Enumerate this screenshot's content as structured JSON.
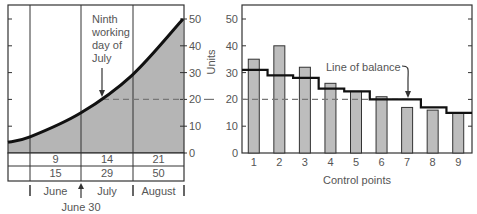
{
  "chart_data": [
    {
      "type": "area",
      "title": "",
      "ylabel": "",
      "ylim": [
        0,
        50
      ],
      "yticks": [
        0,
        10,
        20,
        30,
        40,
        50
      ],
      "annotation": "Ninth working day of July",
      "annotation_lines": [
        "Ninth",
        "working",
        "day of",
        "July"
      ],
      "annotation_value": 20,
      "cumulative_curve": {
        "x_months": [
          -0.4,
          0,
          1,
          2,
          3
        ],
        "values": [
          4,
          6,
          15,
          29,
          50
        ]
      },
      "table": {
        "rows": [
          [
            "",
            "9",
            "14",
            "21"
          ],
          [
            "",
            "15",
            "29",
            "50"
          ]
        ]
      },
      "months": [
        "June",
        "July",
        "August"
      ],
      "marker_label": "June 30",
      "grid": false
    },
    {
      "type": "bar",
      "title": "",
      "xlabel": "Control points",
      "ylabel": "Units",
      "ylim": [
        0,
        50
      ],
      "yticks": [
        0,
        10,
        20,
        30,
        40,
        50
      ],
      "categories": [
        "1",
        "2",
        "3",
        "4",
        "5",
        "6",
        "7",
        "8",
        "9"
      ],
      "series": [
        {
          "name": "Actual units",
          "values": [
            35,
            40,
            32,
            26,
            23,
            21,
            17,
            16,
            15
          ]
        },
        {
          "name": "Line of balance",
          "values": [
            31,
            29,
            28,
            24,
            23,
            20,
            20,
            17,
            15
          ]
        }
      ],
      "reference_line": 20,
      "annotation": "Line of balance",
      "grid": false
    }
  ],
  "colors": {
    "bar_fill": "#bdbdbd",
    "area_fill": "#b5b5b5",
    "line": "#111111",
    "axis": "#333333",
    "text": "#555555"
  }
}
